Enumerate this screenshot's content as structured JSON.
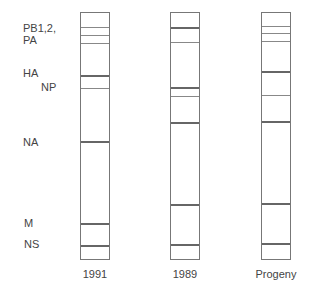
{
  "segment_labels": [
    {
      "text": "PB1,2,",
      "x": 23,
      "y": 22
    },
    {
      "text": "PA",
      "x": 23,
      "y": 34
    },
    {
      "text": "HA",
      "x": 23,
      "y": 67
    },
    {
      "text": "NP",
      "x": 41,
      "y": 81
    },
    {
      "text": "NA",
      "x": 23,
      "y": 136
    },
    {
      "text": "M",
      "x": 24,
      "y": 217
    },
    {
      "text": "NS",
      "x": 24,
      "y": 238
    }
  ],
  "lanes": [
    {
      "label": "1991",
      "x": 80,
      "bands": [
        {
          "y": 27,
          "w": "thin"
        },
        {
          "y": 35,
          "w": "thin"
        },
        {
          "y": 43,
          "w": "thin"
        },
        {
          "y": 75,
          "w": "thick"
        },
        {
          "y": 88,
          "w": "thin"
        },
        {
          "y": 141,
          "w": "thick"
        },
        {
          "y": 223,
          "w": "thick"
        },
        {
          "y": 245,
          "w": "thick"
        }
      ]
    },
    {
      "label": "1989",
      "x": 170,
      "bands": [
        {
          "y": 27,
          "w": "thick"
        },
        {
          "y": 42,
          "w": "thin"
        },
        {
          "y": 87,
          "w": "thick"
        },
        {
          "y": 96,
          "w": "thin"
        },
        {
          "y": 122,
          "w": "thick"
        },
        {
          "y": 204,
          "w": "thick"
        },
        {
          "y": 244,
          "w": "thick"
        }
      ]
    },
    {
      "label": "Progeny",
      "x": 261,
      "bands": [
        {
          "y": 26,
          "w": "thin"
        },
        {
          "y": 33,
          "w": "thin"
        },
        {
          "y": 41,
          "w": "thin"
        },
        {
          "y": 71,
          "w": "thick"
        },
        {
          "y": 95,
          "w": "thin"
        },
        {
          "y": 121,
          "w": "thick"
        },
        {
          "y": 203,
          "w": "thick"
        },
        {
          "y": 243,
          "w": "thick"
        }
      ]
    }
  ]
}
